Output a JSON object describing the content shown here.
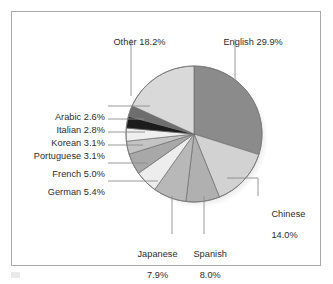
{
  "figure": {
    "name": "internet-language-usage-pie-chart",
    "background": "#ffffff",
    "frame_color": "#a9a9a9"
  },
  "chart_data": {
    "type": "pie",
    "title": "",
    "subtitle": "",
    "xlabel": "",
    "ylabel": "",
    "legend_position": "none",
    "grid": false,
    "label_format": "{name} {value}%",
    "start_angle_deg": 0,
    "direction": "clockwise",
    "units": "percent",
    "total": 100.0,
    "categories": [
      "English",
      "Chinese",
      "Spanish",
      "Japanese",
      "German",
      "French",
      "Portuguese",
      "Korean",
      "Italian",
      "Arabic",
      "Other"
    ],
    "values": [
      29.9,
      14.0,
      8.0,
      7.9,
      5.4,
      5.0,
      3.1,
      3.1,
      2.8,
      2.6,
      18.2
    ],
    "slices": [
      {
        "name": "English",
        "value": 29.9,
        "label": "English 29.9%",
        "color": "#8b8b8b"
      },
      {
        "name": "Chinese",
        "value": 14.0,
        "label": "Chinese 14.0%",
        "color": "#d2d2d2"
      },
      {
        "name": "Spanish",
        "value": 8.0,
        "label": "Spanish 8.0%",
        "color": "#b0b0b0"
      },
      {
        "name": "Japanese",
        "value": 7.9,
        "label": "Japanese 7.9%",
        "color": "#b8b8b8"
      },
      {
        "name": "German",
        "value": 5.4,
        "label": "German 5.4%",
        "color": "#ededed"
      },
      {
        "name": "French",
        "value": 5.0,
        "label": "French 5.0%",
        "color": "#a8a8a8"
      },
      {
        "name": "Portuguese",
        "value": 3.1,
        "label": "Portuguese 3.1%",
        "color": "#c4c4c4"
      },
      {
        "name": "Korean",
        "value": 3.1,
        "label": "Korean 3.1%",
        "color": "#efefef"
      },
      {
        "name": "Italian",
        "value": 2.8,
        "label": "Italian 2.8%",
        "color": "#1c1c1c"
      },
      {
        "name": "Arabic",
        "value": 2.6,
        "label": "Arabic 2.6%",
        "color": "#6e6e6e"
      },
      {
        "name": "Other",
        "value": 18.2,
        "label": "Other 18.2%",
        "color": "#d9d9d9"
      }
    ]
  },
  "labels": {
    "english": {
      "line1": "English 29.9%"
    },
    "other": {
      "line1": "Other 18.2%"
    },
    "chinese": {
      "line1": "Chinese",
      "line2": "14.0%"
    },
    "spanish": {
      "line1": "Spanish",
      "line2": "8.0%"
    },
    "japanese": {
      "line1": "Japanese",
      "line2": "7.9%"
    },
    "german": {
      "line1": "German 5.4%"
    },
    "french": {
      "line1": "French 5.0%"
    },
    "portuguese": {
      "line1": "Portuguese 3.1%"
    },
    "korean": {
      "line1": "Korean 3.1%"
    },
    "italian": {
      "line1": "Italian 2.8%"
    },
    "arabic": {
      "line1": "Arabic 2.6%"
    }
  }
}
